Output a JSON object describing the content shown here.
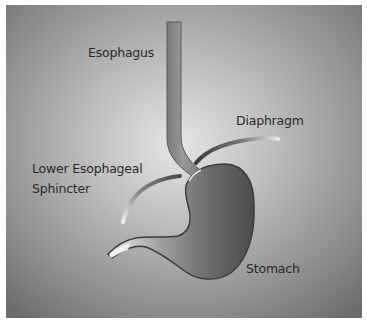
{
  "diagram": {
    "labels": {
      "esophagus": "Esophagus",
      "diaphragm": "Diaphragm",
      "les_line1": "Lower Esophageal",
      "les_line2": "Sphincter",
      "stomach": "Stomach"
    },
    "colors": {
      "page_background": "#ffffff",
      "panel_light": "#e4e4e4",
      "panel_dark": "#6e6e6e",
      "organ_light": "#d8d8d8",
      "organ_mid": "#8a8a8a",
      "organ_dark": "#4a4a4a",
      "outline": "#3c3c3c",
      "label_text": "#2a2a2a"
    }
  }
}
